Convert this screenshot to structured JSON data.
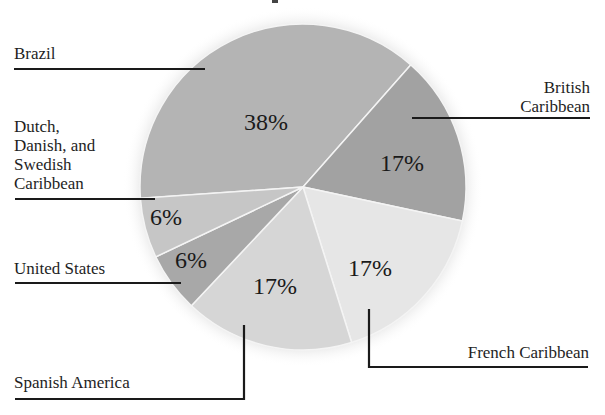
{
  "chart_data": {
    "type": "pie",
    "title": "",
    "categories": [
      "Brazil",
      "British Caribbean",
      "French Caribbean",
      "Spanish America",
      "United States",
      "Dutch, Danish, and Swedish Caribbean"
    ],
    "values": [
      38,
      17,
      17,
      17,
      6,
      6
    ],
    "value_labels": [
      "38%",
      "17%",
      "17%",
      "17%",
      "6%",
      "6%"
    ],
    "legend": "callout labels with leader lines",
    "colors": [
      "#b4b4b4",
      "#a2a2a2",
      "#e6e6e6",
      "#d6d6d6",
      "#a8a8a8",
      "#c6c6c6"
    ]
  },
  "labels": {
    "brazil": "Brazil",
    "british_1": "British",
    "british_2": "Caribbean",
    "dutch_1": "Dutch,",
    "dutch_2": "Danish, and",
    "dutch_3": "Swedish",
    "dutch_4": "Caribbean",
    "us": "United States",
    "spanish": "Spanish America",
    "french": "French Caribbean"
  },
  "percents": {
    "brazil": "38%",
    "british": "17%",
    "french": "17%",
    "spanish": "17%",
    "us": "6%",
    "dutch": "6%"
  }
}
